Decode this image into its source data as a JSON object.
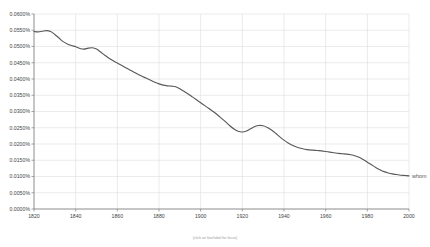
{
  "chart_data": {
    "type": "line",
    "title": "",
    "subtitle": "",
    "xlabel": "",
    "ylabel": "",
    "xlim": [
      1820,
      2000
    ],
    "ylim": [
      0.0,
      0.06
    ],
    "grid": true,
    "legend_position": "right-inline",
    "y_unit": "%",
    "x_ticks": [
      1820,
      1840,
      1860,
      1880,
      1900,
      1920,
      1940,
      1960,
      1980,
      2000
    ],
    "x_tick_labels": [
      "1820",
      "1840",
      "1860",
      "1880",
      "1900",
      "1920",
      "1940",
      "1960",
      "1980",
      "2000"
    ],
    "y_ticks": [
      0.06,
      0.055,
      0.05,
      0.045,
      0.04,
      0.035,
      0.03,
      0.025,
      0.02,
      0.015,
      0.01,
      0.005,
      0.0
    ],
    "y_tick_labels": [
      "0.0600%",
      "0.0550%",
      "0.0500%",
      "0.0450%",
      "0.0400%",
      "0.0350%",
      "0.0300%",
      "0.0250%",
      "0.0200%",
      "0.0150%",
      "0.0100%",
      "0.0050%",
      "0.0000%"
    ],
    "series": [
      {
        "name": "whom",
        "color": "#58595b",
        "x": [
          1820,
          1822,
          1824,
          1826,
          1828,
          1830,
          1832,
          1834,
          1836,
          1838,
          1840,
          1842,
          1844,
          1846,
          1848,
          1850,
          1852,
          1854,
          1856,
          1858,
          1860,
          1862,
          1864,
          1866,
          1868,
          1870,
          1872,
          1874,
          1876,
          1878,
          1880,
          1882,
          1884,
          1886,
          1888,
          1890,
          1892,
          1894,
          1896,
          1898,
          1900,
          1902,
          1904,
          1906,
          1908,
          1910,
          1912,
          1914,
          1916,
          1918,
          1920,
          1922,
          1924,
          1926,
          1928,
          1930,
          1932,
          1934,
          1936,
          1938,
          1940,
          1942,
          1944,
          1946,
          1948,
          1950,
          1952,
          1954,
          1956,
          1958,
          1960,
          1962,
          1964,
          1966,
          1968,
          1970,
          1972,
          1974,
          1976,
          1978,
          1980,
          1982,
          1984,
          1986,
          1988,
          1990,
          1992,
          1994,
          1996,
          1998,
          2000
        ],
        "values": [
          0.0546,
          0.0545,
          0.0547,
          0.0549,
          0.0546,
          0.0537,
          0.0526,
          0.0515,
          0.0508,
          0.0503,
          0.0499,
          0.0494,
          0.0492,
          0.0495,
          0.0496,
          0.0492,
          0.0483,
          0.0473,
          0.0464,
          0.0456,
          0.0449,
          0.0442,
          0.0435,
          0.0428,
          0.0421,
          0.0414,
          0.0408,
          0.0402,
          0.0396,
          0.039,
          0.0385,
          0.0381,
          0.0379,
          0.0378,
          0.0376,
          0.037,
          0.0362,
          0.0354,
          0.0345,
          0.0336,
          0.0327,
          0.0318,
          0.0309,
          0.03,
          0.029,
          0.0279,
          0.0268,
          0.0256,
          0.0246,
          0.0239,
          0.0237,
          0.024,
          0.0247,
          0.0254,
          0.0257,
          0.0256,
          0.0251,
          0.0243,
          0.0233,
          0.0222,
          0.0212,
          0.0203,
          0.0196,
          0.0191,
          0.0187,
          0.0184,
          0.0182,
          0.0181,
          0.018,
          0.0179,
          0.0177,
          0.0175,
          0.0173,
          0.0171,
          0.017,
          0.0169,
          0.0167,
          0.0164,
          0.0159,
          0.0152,
          0.0144,
          0.0136,
          0.0128,
          0.0121,
          0.0115,
          0.0111,
          0.0108,
          0.0106,
          0.0104,
          0.0103,
          0.0102
        ]
      }
    ],
    "series_inline_labels": [
      "whom"
    ],
    "footer_note": "(click on line/label for focus)"
  }
}
